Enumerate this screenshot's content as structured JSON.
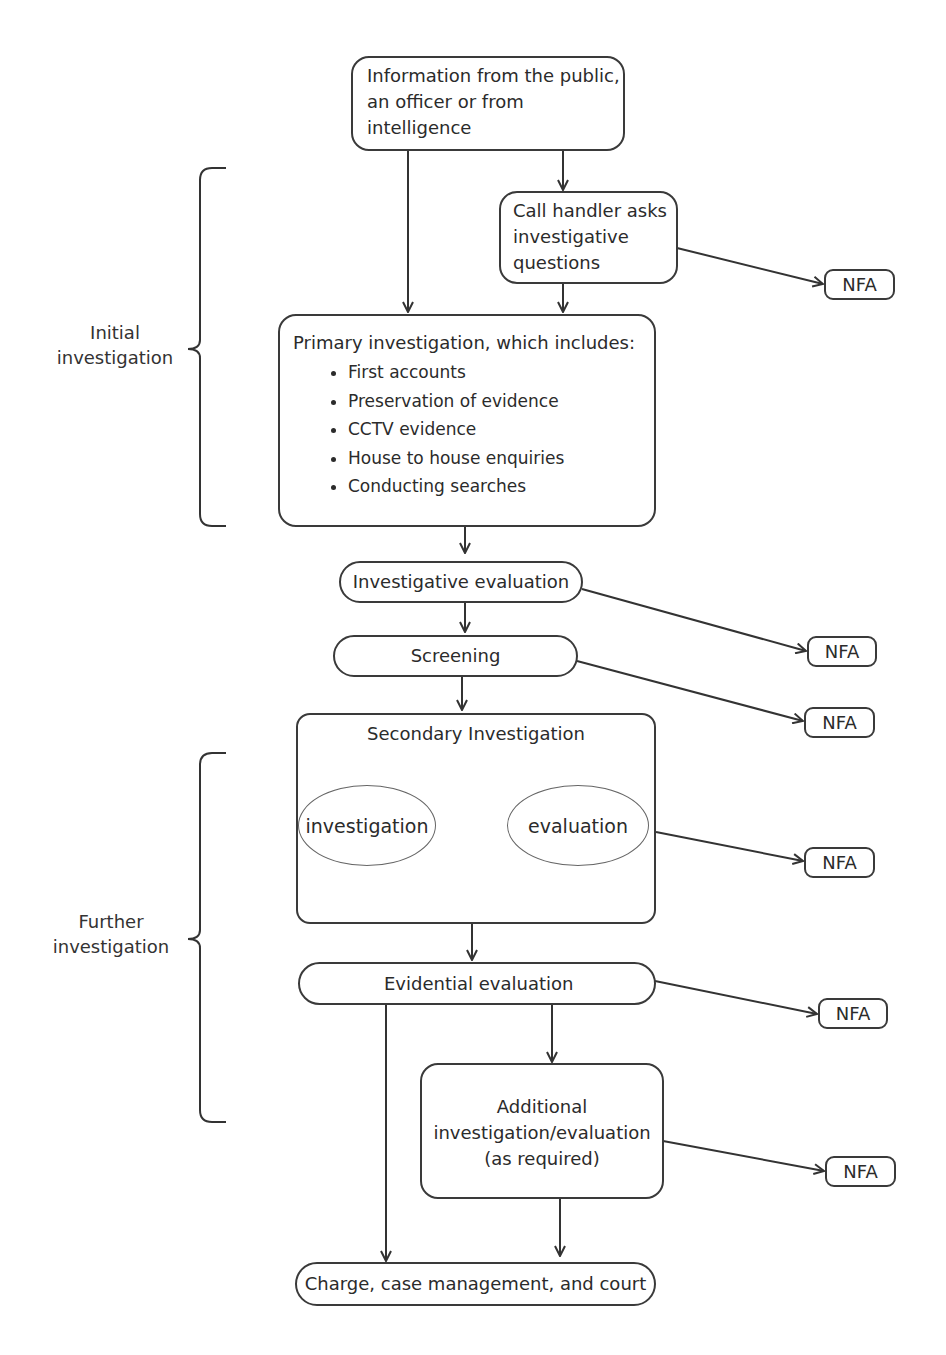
{
  "nodes": {
    "information": {
      "lines": [
        "Information from the public,",
        "an officer or from",
        "intelligence"
      ]
    },
    "call_handler": {
      "lines": [
        "Call handler asks",
        "investigative",
        "questions"
      ]
    },
    "primary": {
      "title": "Primary investigation, which includes:",
      "items": [
        "First accounts",
        "Preservation of evidence",
        "CCTV evidence",
        "House to house enquiries",
        "Conducting searches"
      ]
    },
    "investigative_evaluation": {
      "label": "Investigative evaluation"
    },
    "screening": {
      "label": "Screening"
    },
    "secondary": {
      "title": "Secondary Investigation",
      "left_ellipse": "investigation",
      "right_ellipse": "evaluation"
    },
    "evidential_evaluation": {
      "label": "Evidential evaluation"
    },
    "additional": {
      "lines": [
        "Additional",
        "investigation/evaluation",
        "(as required)"
      ]
    },
    "charge": {
      "label": "Charge, case management, and court"
    }
  },
  "nfa_label": "NFA",
  "nfa_boxes": [
    "NFA",
    "NFA",
    "NFA",
    "NFA",
    "NFA",
    "NFA"
  ],
  "brackets": {
    "initial": {
      "lines": [
        "Initial",
        "investigation"
      ]
    },
    "further": {
      "lines": [
        "Further",
        "investigation"
      ]
    }
  },
  "colors": {
    "line": "#333333",
    "cycle_arrow": "#4a4a4a",
    "ellipse_border": "#777777"
  }
}
